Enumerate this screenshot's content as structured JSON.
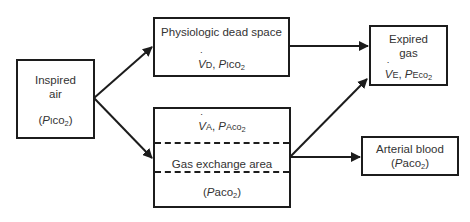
{
  "diagram": {
    "nodes": {
      "inspired_air": {
        "label_line1": "Inspired",
        "label_line2": "air",
        "param_prefix": "(",
        "param_P": "P",
        "param_sub_letter": "I",
        "param_co": "co",
        "param_2": "2",
        "param_suffix": ")"
      },
      "dead_space": {
        "label": "Physiologic dead space",
        "flow_V": "V",
        "flow_sub": "D",
        "sep": ", ",
        "param_P": "P",
        "param_sub_letter": "I",
        "param_co": "co",
        "param_2": "2"
      },
      "gas_exchange": {
        "top_V": "V",
        "top_sub": "A",
        "top_sep": ", ",
        "top_P": "P",
        "top_sub_letter": "A",
        "top_co": "co",
        "top_2": "2",
        "label": "Gas exchange area",
        "bottom_prefix": "(",
        "bottom_P": "P",
        "bottom_sub": "a",
        "bottom_co": "co",
        "bottom_2": "2",
        "bottom_suffix": ")"
      },
      "expired_gas": {
        "label_line1": "Expired",
        "label_line2": "gas",
        "flow_V": "V",
        "flow_sub": "E",
        "sep": ", ",
        "param_P": "P",
        "param_sub_letter": "E",
        "param_co": "co",
        "param_2": "2"
      },
      "arterial_blood": {
        "label": "Arterial blood",
        "param_prefix": "(",
        "param_P": "P",
        "param_sub": "a",
        "param_co": "co",
        "param_2": "2",
        "param_suffix": ")"
      }
    },
    "edges": [
      {
        "from": "inspired_air",
        "to": "dead_space"
      },
      {
        "from": "inspired_air",
        "to": "gas_exchange"
      },
      {
        "from": "dead_space",
        "to": "expired_gas"
      },
      {
        "from": "gas_exchange",
        "to": "expired_gas"
      },
      {
        "from": "gas_exchange",
        "to": "arterial_blood"
      }
    ],
    "colors": {
      "stroke": "#1c1c1c",
      "text": "#333333",
      "background": "#ffffff"
    }
  }
}
